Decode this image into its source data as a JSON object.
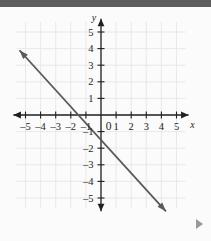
{
  "page": {
    "background_color": "#fbfbfb",
    "top_bar_color": "#5d5d5d"
  },
  "advance_control": {
    "icon": "play-triangle-icon",
    "label": "▶"
  },
  "chart_data": {
    "type": "line",
    "title": "",
    "subtitle": "",
    "xlabel": "x",
    "ylabel": "y",
    "xlim": [
      -5.8,
      5.8
    ],
    "ylim": [
      -5.8,
      5.8
    ],
    "grid": true,
    "grid_color": "#e3e3ea",
    "grid_step": 1,
    "axis_color": "#231f20",
    "line_color": "#595959",
    "legend": "none",
    "origin_label": "0",
    "x_ticks": [
      -5,
      -4,
      -3,
      -2,
      -1,
      1,
      2,
      3,
      4,
      5
    ],
    "x_tick_labels": [
      "–5",
      "–4",
      "–3",
      "–2",
      "–1",
      "1",
      "2",
      "3",
      "4",
      "5"
    ],
    "y_ticks": [
      5,
      4,
      3,
      2,
      1,
      -1,
      -2,
      -3,
      -4,
      -5
    ],
    "y_tick_labels": [
      "5",
      "4",
      "3",
      "2",
      "1",
      "–1",
      "–2",
      "–3",
      "–4",
      "–5"
    ],
    "series": [
      {
        "name": "line",
        "equation": "y = -x - 1.5",
        "slope": -1,
        "intercept": -1.5,
        "x_intercept": -1.5,
        "y_intercept": -1.5,
        "arrow_start": [
          -5.4,
          3.9
        ],
        "arrow_end": [
          4.3,
          -5.8
        ],
        "points": [
          [
            -5.4,
            3.9
          ],
          [
            -1.5,
            0
          ],
          [
            0,
            -1.5
          ],
          [
            4.3,
            -5.8
          ]
        ]
      }
    ]
  }
}
